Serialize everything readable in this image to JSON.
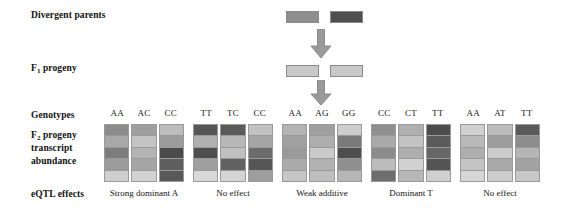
{
  "figure": {
    "type": "genetics-cross-diagram",
    "row_labels": {
      "divergent_parents": "Divergent parents",
      "f1_progeny_pre": "F",
      "f1_progeny_sub": "1",
      "f1_progeny_post": " progeny",
      "genotypes": "Genotypes",
      "f2_pre": "F",
      "f2_sub": "2",
      "f2_post": " progeny",
      "f2_line2": "transcript",
      "f2_line3": "abundance",
      "eqtl_effects": "eQTL effects"
    },
    "parents": [
      {
        "name": "parent-1",
        "shade": "#8e8e8e",
        "striped": false
      },
      {
        "name": "parent-2",
        "shade": "#4f4f4f",
        "striped": true
      }
    ],
    "f1": [
      {
        "name": "f1-1",
        "shade": "#c9c9c9",
        "striped": false
      },
      {
        "name": "f1-2",
        "shade": "#c9c9c9",
        "striped": false
      }
    ],
    "arrows": [
      {
        "name": "arrow-parents-to-f1",
        "color": "#9a9a9a"
      },
      {
        "name": "arrow-f1-to-f2",
        "color": "#9a9a9a"
      }
    ],
    "groups": [
      {
        "id": "group-1",
        "effect": "Strong dominant A",
        "genotypes": [
          "AA",
          "AC",
          "CC"
        ],
        "columns": [
          [
            "#8c8c8c",
            "#a8a8a8",
            "#7d7d7d",
            "#9b9b9b",
            "#cfcfcf"
          ],
          [
            "#9e9e9e",
            "#c4c4c4",
            "#b4b4b4",
            "#a6a6a6",
            "#d2d2d2"
          ],
          [
            "#bdbdbd",
            "#9c9c9c",
            "#4a4a4a",
            "#5e5e5e",
            "#585858"
          ]
        ]
      },
      {
        "id": "group-2",
        "effect": "No effect",
        "genotypes": [
          "TT",
          "TC",
          "CC"
        ],
        "columns": [
          [
            "#565656",
            "#b0b0b0",
            "#4e4e4e",
            "#9f9f9f",
            "#d8d8d8"
          ],
          [
            "#5a5a5a",
            "#b8b8b8",
            "#c0c0c0",
            "#616161",
            "#d4d4d4"
          ],
          [
            "#c2c2c2",
            "#a5a5a5",
            "#6b6b6b",
            "#565656",
            "#9d9d9d"
          ]
        ]
      },
      {
        "id": "group-3",
        "effect": "Weak additive",
        "genotypes": [
          "AA",
          "AG",
          "GG"
        ],
        "columns": [
          [
            "#b4b4b4",
            "#a0a0a0",
            "#9a9a9a",
            "#ababab",
            "#c6c6c6"
          ],
          [
            "#9f9f9f",
            "#adadad",
            "#cacaca",
            "#b2b2b2",
            "#bebebe"
          ],
          [
            "#cdcdcd",
            "#7a7a7a",
            "#4d4d4d",
            "#8f8f8f",
            "#b6b6b6"
          ]
        ]
      },
      {
        "id": "group-4",
        "effect": "Dominant T",
        "genotypes": [
          "CC",
          "CT",
          "TT"
        ],
        "columns": [
          [
            "#8f8f8f",
            "#a9a9a9",
            "#8b8b8b",
            "#bcbcbc",
            "#6e6e6e"
          ],
          [
            "#b0b0b0",
            "#c3c3c3",
            "#aeaeae",
            "#d2d2d2",
            "#b7b7b7"
          ],
          [
            "#4c4c4c",
            "#5b5b5b",
            "#666666",
            "#545454",
            "#cfcfcf"
          ]
        ]
      },
      {
        "id": "group-5",
        "effect": "No effect",
        "genotypes": [
          "AA",
          "AT",
          "TT"
        ],
        "columns": [
          [
            "#d0d0d0",
            "#b9b9b9",
            "#aeaeae",
            "#c4c4c4",
            "#d6d6d6"
          ],
          [
            "#bcbcbc",
            "#9d9d9d",
            "#cbcbcb",
            "#a9a9a9",
            "#cdcdcd"
          ],
          [
            "#5a5a5a",
            "#8d8d8d",
            "#b5b5b5",
            "#a2a2a2",
            "#c8c8c8"
          ]
        ]
      }
    ]
  }
}
